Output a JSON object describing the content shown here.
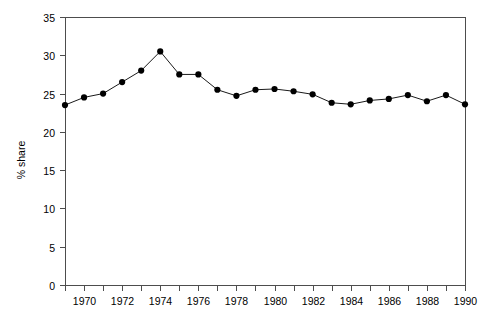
{
  "chart_data": {
    "type": "line",
    "title": "",
    "subtitle": "",
    "xlabel": "",
    "ylabel": "% share",
    "xlim": [
      1969,
      1990
    ],
    "ylim": [
      0,
      35
    ],
    "yticks": [
      0,
      5,
      10,
      15,
      20,
      25,
      30,
      35
    ],
    "ytick_labels": [
      "0",
      "5",
      "10",
      "15",
      "20",
      "25",
      "30",
      "35"
    ],
    "xticks": [
      1969,
      1970,
      1971,
      1972,
      1973,
      1974,
      1975,
      1976,
      1977,
      1978,
      1979,
      1980,
      1981,
      1982,
      1983,
      1984,
      1985,
      1986,
      1987,
      1988,
      1989,
      1990
    ],
    "xtick_labels_shown": [
      "1970",
      "1972",
      "1974",
      "1976",
      "1978",
      "1980",
      "1982",
      "1984",
      "1986",
      "1988",
      "1990"
    ],
    "grid": false,
    "legend": null,
    "legend_position": "none",
    "marker": "filled-circle",
    "line_color": "#1a1a1a",
    "marker_color": "#000000",
    "axis_color": "#4d4d4d",
    "background_color": "#ffffff",
    "x": [
      1969,
      1970,
      1971,
      1972,
      1973,
      1974,
      1975,
      1976,
      1977,
      1978,
      1979,
      1980,
      1981,
      1982,
      1983,
      1984,
      1985,
      1986,
      1987,
      1988,
      1989,
      1990
    ],
    "values": [
      23.5,
      24.5,
      25.0,
      26.5,
      28.0,
      30.5,
      27.5,
      27.5,
      25.5,
      24.7,
      25.5,
      25.6,
      25.3,
      24.9,
      23.8,
      23.6,
      24.1,
      24.3,
      24.8,
      24.0,
      24.8,
      23.6
    ],
    "series": [
      {
        "name": "% share",
        "values": [
          23.5,
          24.5,
          25.0,
          26.5,
          28.0,
          30.5,
          27.5,
          27.5,
          25.5,
          24.7,
          25.5,
          25.6,
          25.3,
          24.9,
          23.8,
          23.6,
          24.1,
          24.3,
          24.8,
          24.0,
          24.8,
          23.6
        ]
      }
    ],
    "annotations": []
  },
  "plot": {
    "left": 65,
    "right": 465,
    "top": 17,
    "bottom": 285
  }
}
